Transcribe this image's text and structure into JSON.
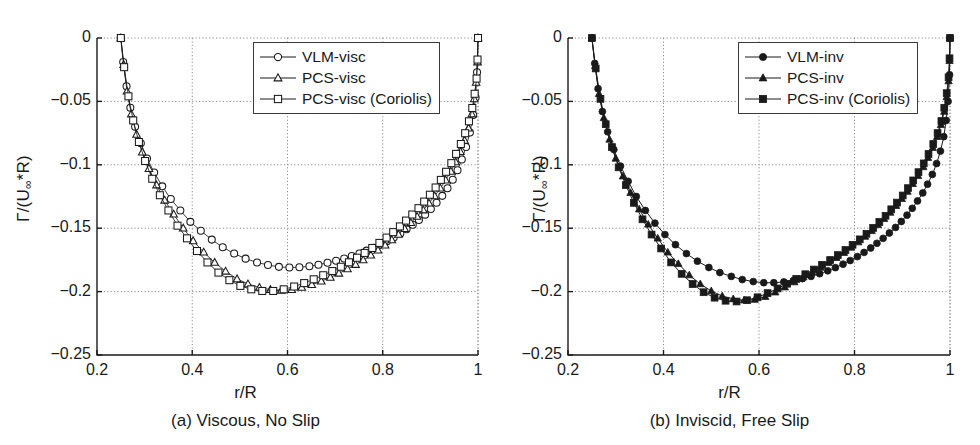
{
  "figure": {
    "width": 980,
    "height": 445,
    "background": "#ffffff",
    "ink_color": "#1a1a1a",
    "grid_color": "#8c8c8c"
  },
  "panels": [
    {
      "id": "a",
      "caption": "(a) Viscous, No Slip",
      "xlabel": "r/R",
      "ylabel_main": "Γ/(U",
      "ylabel_sub": "∞",
      "ylabel_tail": "*R)",
      "legend_entries": [
        {
          "label": "VLM-visc",
          "marker": "circle",
          "filled": false
        },
        {
          "label": "PCS-visc",
          "marker": "triangle",
          "filled": false
        },
        {
          "label": "PCS-visc (Coriolis)",
          "marker": "square",
          "filled": false
        }
      ]
    },
    {
      "id": "b",
      "caption": "(b) Inviscid, Free Slip",
      "xlabel": "r/R",
      "ylabel_main": "Γ/(U",
      "ylabel_sub": "∞",
      "ylabel_tail": "*R)",
      "legend_entries": [
        {
          "label": "VLM-inv",
          "marker": "circle",
          "filled": true
        },
        {
          "label": "PCS-inv",
          "marker": "triangle",
          "filled": true
        },
        {
          "label": "PCS-inv (Coriolis)",
          "marker": "square",
          "filled": true
        }
      ]
    }
  ],
  "chart_data": [
    {
      "type": "line",
      "panel": "a",
      "title": "(a) Viscous, No Slip",
      "xlabel": "r/R",
      "ylabel": "Γ/(U∞*R)",
      "xlim": [
        0.2,
        1.0
      ],
      "ylim": [
        -0.25,
        0.0
      ],
      "xticks": [
        0.2,
        0.4,
        0.6,
        0.8,
        1
      ],
      "xticklabels": [
        "0.2",
        "0.4",
        "0.6",
        "0.8",
        "1"
      ],
      "yticks": [
        0,
        -0.05,
        -0.1,
        -0.15,
        -0.2,
        -0.25
      ],
      "yticklabels": [
        "0",
        "−0.05",
        "−0.1",
        "−0.15",
        "−0.2",
        "−0.25"
      ],
      "grid": true,
      "legend_position": "upper right",
      "series": [
        {
          "name": "VLM-visc",
          "marker": "circle",
          "filled": false,
          "x": [
            0.25,
            0.255,
            0.262,
            0.27,
            0.28,
            0.292,
            0.305,
            0.32,
            0.337,
            0.355,
            0.375,
            0.396,
            0.418,
            0.441,
            0.464,
            0.488,
            0.512,
            0.536,
            0.559,
            0.582,
            0.604,
            0.625,
            0.646,
            0.665,
            0.684,
            0.702,
            0.719,
            0.735,
            0.751,
            0.766,
            0.781,
            0.795,
            0.809,
            0.823,
            0.837,
            0.85,
            0.863,
            0.876,
            0.889,
            0.901,
            0.913,
            0.925,
            0.936,
            0.947,
            0.957,
            0.966,
            0.975,
            0.983,
            0.99,
            0.995,
            0.998,
            1.0
          ],
          "y": [
            0.0,
            -0.019,
            -0.038,
            -0.055,
            -0.07,
            -0.083,
            -0.095,
            -0.106,
            -0.117,
            -0.127,
            -0.136,
            -0.145,
            -0.152,
            -0.159,
            -0.165,
            -0.17,
            -0.174,
            -0.177,
            -0.179,
            -0.1805,
            -0.181,
            -0.1808,
            -0.18,
            -0.1788,
            -0.1773,
            -0.1757,
            -0.1739,
            -0.172,
            -0.1699,
            -0.1677,
            -0.1654,
            -0.1629,
            -0.1602,
            -0.1573,
            -0.1542,
            -0.1509,
            -0.1473,
            -0.1435,
            -0.1393,
            -0.1348,
            -0.1299,
            -0.1245,
            -0.1185,
            -0.1118,
            -0.1043,
            -0.0958,
            -0.086,
            -0.0745,
            -0.0608,
            -0.047,
            -0.027,
            0.0
          ]
        },
        {
          "name": "PCS-visc",
          "marker": "triangle",
          "filled": false,
          "x": [
            0.25,
            0.256,
            0.263,
            0.272,
            0.283,
            0.295,
            0.309,
            0.325,
            0.342,
            0.361,
            0.381,
            0.402,
            0.424,
            0.447,
            0.47,
            0.494,
            0.517,
            0.541,
            0.564,
            0.587,
            0.609,
            0.63,
            0.651,
            0.671,
            0.69,
            0.708,
            0.726,
            0.743,
            0.759,
            0.775,
            0.79,
            0.805,
            0.819,
            0.833,
            0.846,
            0.859,
            0.872,
            0.885,
            0.897,
            0.909,
            0.921,
            0.932,
            0.943,
            0.953,
            0.963,
            0.972,
            0.98,
            0.987,
            0.992,
            0.996,
            0.999,
            1.0
          ],
          "y": [
            0.0,
            -0.021,
            -0.042,
            -0.06,
            -0.076,
            -0.09,
            -0.103,
            -0.116,
            -0.128,
            -0.139,
            -0.15,
            -0.16,
            -0.169,
            -0.177,
            -0.184,
            -0.19,
            -0.194,
            -0.1968,
            -0.1985,
            -0.199,
            -0.1985,
            -0.1968,
            -0.1945,
            -0.1918,
            -0.1888,
            -0.1856,
            -0.1822,
            -0.1787,
            -0.1751,
            -0.1713,
            -0.1674,
            -0.1634,
            -0.1592,
            -0.1549,
            -0.1504,
            -0.1457,
            -0.1408,
            -0.1357,
            -0.1303,
            -0.1246,
            -0.1185,
            -0.1121,
            -0.1052,
            -0.0978,
            -0.0897,
            -0.0809,
            -0.0711,
            -0.06,
            -0.048,
            -0.035,
            -0.019,
            0.0
          ]
        },
        {
          "name": "PCS-visc (Coriolis)",
          "marker": "square",
          "filled": false,
          "x": [
            0.25,
            0.257,
            0.266,
            0.276,
            0.288,
            0.301,
            0.316,
            0.332,
            0.35,
            0.369,
            0.389,
            0.41,
            0.432,
            0.455,
            0.478,
            0.501,
            0.524,
            0.547,
            0.57,
            0.592,
            0.614,
            0.635,
            0.655,
            0.675,
            0.694,
            0.712,
            0.729,
            0.746,
            0.762,
            0.778,
            0.793,
            0.808,
            0.822,
            0.836,
            0.849,
            0.862,
            0.875,
            0.887,
            0.899,
            0.911,
            0.922,
            0.933,
            0.944,
            0.954,
            0.964,
            0.973,
            0.981,
            0.988,
            0.993,
            0.997,
            0.999,
            1.0
          ],
          "y": [
            0.0,
            -0.023,
            -0.046,
            -0.065,
            -0.082,
            -0.097,
            -0.111,
            -0.124,
            -0.136,
            -0.148,
            -0.158,
            -0.168,
            -0.177,
            -0.185,
            -0.191,
            -0.1955,
            -0.1982,
            -0.1995,
            -0.1995,
            -0.1982,
            -0.196,
            -0.1933,
            -0.1903,
            -0.1871,
            -0.1838,
            -0.1804,
            -0.1769,
            -0.1733,
            -0.1695,
            -0.1656,
            -0.1616,
            -0.1574,
            -0.1531,
            -0.1486,
            -0.144,
            -0.1392,
            -0.1342,
            -0.129,
            -0.1236,
            -0.1179,
            -0.1119,
            -0.1055,
            -0.0987,
            -0.0914,
            -0.0836,
            -0.0751,
            -0.0657,
            -0.0552,
            -0.044,
            -0.032,
            -0.017,
            0.0
          ]
        }
      ]
    },
    {
      "type": "line",
      "panel": "b",
      "title": "(b) Inviscid, Free Slip",
      "xlabel": "r/R",
      "ylabel": "Γ/(U∞*R)",
      "xlim": [
        0.2,
        1.0
      ],
      "ylim": [
        -0.25,
        0.0
      ],
      "xticks": [
        0.2,
        0.4,
        0.6,
        0.8,
        1
      ],
      "xticklabels": [
        "0.2",
        "0.4",
        "0.6",
        "0.8",
        "1"
      ],
      "yticks": [
        0,
        -0.05,
        -0.1,
        -0.15,
        -0.2,
        -0.25
      ],
      "yticklabels": [
        "0",
        "−0.05",
        "−0.1",
        "−0.15",
        "−0.2",
        "−0.25"
      ],
      "grid": true,
      "legend_position": "upper right",
      "series": [
        {
          "name": "VLM-inv",
          "marker": "circle",
          "filled": true,
          "x": [
            0.25,
            0.256,
            0.263,
            0.272,
            0.283,
            0.296,
            0.31,
            0.326,
            0.343,
            0.362,
            0.382,
            0.403,
            0.425,
            0.448,
            0.471,
            0.495,
            0.518,
            0.542,
            0.565,
            0.588,
            0.61,
            0.631,
            0.652,
            0.672,
            0.691,
            0.709,
            0.727,
            0.744,
            0.76,
            0.776,
            0.791,
            0.806,
            0.82,
            0.834,
            0.847,
            0.86,
            0.873,
            0.886,
            0.898,
            0.91,
            0.921,
            0.932,
            0.943,
            0.953,
            0.963,
            0.972,
            0.98,
            0.987,
            0.992,
            0.996,
            0.999,
            1.0
          ],
          "y": [
            0.0,
            -0.02,
            -0.04,
            -0.058,
            -0.074,
            -0.088,
            -0.101,
            -0.113,
            -0.125,
            -0.136,
            -0.146,
            -0.155,
            -0.163,
            -0.17,
            -0.176,
            -0.181,
            -0.185,
            -0.188,
            -0.1905,
            -0.1921,
            -0.193,
            -0.193,
            -0.1924,
            -0.1913,
            -0.1898,
            -0.188,
            -0.1859,
            -0.1836,
            -0.1811,
            -0.1784,
            -0.1755,
            -0.1724,
            -0.1691,
            -0.1656,
            -0.1619,
            -0.158,
            -0.1538,
            -0.1494,
            -0.1447,
            -0.1397,
            -0.1343,
            -0.1285,
            -0.1222,
            -0.1153,
            -0.1076,
            -0.099,
            -0.0892,
            -0.0778,
            -0.065,
            -0.05,
            -0.029,
            0.0
          ]
        },
        {
          "name": "PCS-inv",
          "marker": "triangle",
          "filled": true,
          "x": [
            0.25,
            0.257,
            0.265,
            0.275,
            0.287,
            0.3,
            0.315,
            0.331,
            0.349,
            0.368,
            0.388,
            0.409,
            0.431,
            0.454,
            0.477,
            0.5,
            0.523,
            0.546,
            0.569,
            0.591,
            0.613,
            0.634,
            0.654,
            0.674,
            0.693,
            0.711,
            0.729,
            0.746,
            0.762,
            0.778,
            0.793,
            0.808,
            0.822,
            0.836,
            0.849,
            0.862,
            0.875,
            0.887,
            0.899,
            0.911,
            0.922,
            0.933,
            0.944,
            0.954,
            0.964,
            0.973,
            0.981,
            0.988,
            0.993,
            0.997,
            0.999,
            1.0
          ],
          "y": [
            0.0,
            -0.022,
            -0.044,
            -0.063,
            -0.08,
            -0.095,
            -0.109,
            -0.122,
            -0.135,
            -0.147,
            -0.158,
            -0.169,
            -0.178,
            -0.187,
            -0.194,
            -0.1995,
            -0.2035,
            -0.2058,
            -0.2068,
            -0.2063,
            -0.204,
            -0.2005,
            -0.1965,
            -0.1925,
            -0.1886,
            -0.1848,
            -0.181,
            -0.1772,
            -0.1733,
            -0.1693,
            -0.1652,
            -0.161,
            -0.1566,
            -0.1521,
            -0.1474,
            -0.1426,
            -0.1376,
            -0.1323,
            -0.1268,
            -0.1211,
            -0.115,
            -0.1086,
            -0.1017,
            -0.0944,
            -0.0865,
            -0.0779,
            -0.0685,
            -0.058,
            -0.0465,
            -0.034,
            -0.018,
            0.0
          ]
        },
        {
          "name": "PCS-inv (Coriolis)",
          "marker": "square",
          "filled": true,
          "x": [
            0.25,
            0.258,
            0.268,
            0.279,
            0.292,
            0.306,
            0.321,
            0.338,
            0.356,
            0.375,
            0.395,
            0.416,
            0.438,
            0.461,
            0.484,
            0.507,
            0.53,
            0.553,
            0.575,
            0.597,
            0.618,
            0.639,
            0.659,
            0.678,
            0.697,
            0.715,
            0.732,
            0.749,
            0.765,
            0.781,
            0.796,
            0.811,
            0.825,
            0.839,
            0.852,
            0.865,
            0.877,
            0.889,
            0.901,
            0.912,
            0.923,
            0.934,
            0.945,
            0.955,
            0.965,
            0.974,
            0.982,
            0.988,
            0.993,
            0.997,
            0.999,
            1.0
          ],
          "y": [
            0.0,
            -0.024,
            -0.048,
            -0.068,
            -0.086,
            -0.102,
            -0.116,
            -0.13,
            -0.143,
            -0.155,
            -0.166,
            -0.177,
            -0.186,
            -0.194,
            -0.2005,
            -0.2048,
            -0.2072,
            -0.2078,
            -0.2068,
            -0.2045,
            -0.2012,
            -0.1975,
            -0.1938,
            -0.19,
            -0.1863,
            -0.1826,
            -0.1789,
            -0.1751,
            -0.1712,
            -0.1672,
            -0.1631,
            -0.1588,
            -0.1544,
            -0.1498,
            -0.1451,
            -0.1402,
            -0.1351,
            -0.1298,
            -0.1242,
            -0.1184,
            -0.1123,
            -0.1058,
            -0.0989,
            -0.0915,
            -0.0836,
            -0.075,
            -0.0655,
            -0.055,
            -0.0435,
            -0.031,
            -0.016,
            0.0
          ]
        }
      ]
    }
  ]
}
